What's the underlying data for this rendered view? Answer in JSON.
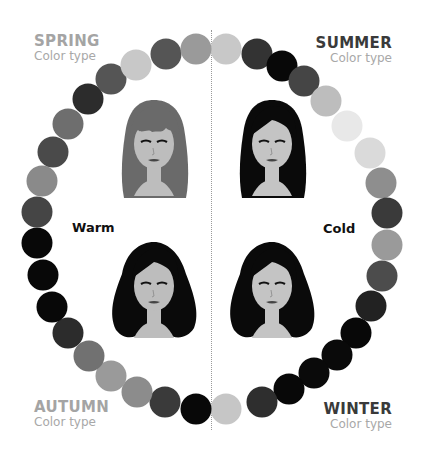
{
  "seasons": {
    "spring": {
      "name": "SPRING",
      "subtitle": "Color type"
    },
    "summer": {
      "name": "SUMMER",
      "subtitle": "Color type"
    },
    "autumn": {
      "name": "AUTUMN",
      "subtitle": "Color type"
    },
    "winter": {
      "name": "WINTER",
      "subtitle": "Color type"
    }
  },
  "axis_labels": {
    "warm": "Warm",
    "cold": "Cold"
  },
  "portraits": [
    {
      "id": "spring",
      "hair": "#6a6a6a",
      "skin": "#bdbdbd",
      "x": 104,
      "y": 92
    },
    {
      "id": "summer",
      "hair": "#0a0a0a",
      "skin": "#c4c4c4",
      "x": 222,
      "y": 92
    },
    {
      "id": "autumn",
      "hair": "#0a0a0a",
      "skin": "#bdbdbd",
      "x": 104,
      "y": 234
    },
    {
      "id": "winter",
      "hair": "#0a0a0a",
      "skin": "#c4c4c4",
      "x": 222,
      "y": 234
    }
  ],
  "ring": [
    {
      "x": 226,
      "y": 49,
      "c": "#c8c8c8"
    },
    {
      "x": 257,
      "y": 54,
      "c": "#333333"
    },
    {
      "x": 282,
      "y": 66,
      "c": "#080808"
    },
    {
      "x": 304,
      "y": 81,
      "c": "#454545"
    },
    {
      "x": 326,
      "y": 101,
      "c": "#bdbdbd"
    },
    {
      "x": 347,
      "y": 126,
      "c": "#e8e8e8"
    },
    {
      "x": 370,
      "y": 153,
      "c": "#dadada"
    },
    {
      "x": 381,
      "y": 183,
      "c": "#8e8e8e"
    },
    {
      "x": 387,
      "y": 213,
      "c": "#3a3a3a"
    },
    {
      "x": 387,
      "y": 245,
      "c": "#9a9a9a"
    },
    {
      "x": 382,
      "y": 276,
      "c": "#4c4c4c"
    },
    {
      "x": 371,
      "y": 306,
      "c": "#222222"
    },
    {
      "x": 356,
      "y": 333,
      "c": "#080808"
    },
    {
      "x": 337,
      "y": 355,
      "c": "#0a0a0a"
    },
    {
      "x": 314,
      "y": 373,
      "c": "#0a0a0a"
    },
    {
      "x": 289,
      "y": 389,
      "c": "#080808"
    },
    {
      "x": 262,
      "y": 402,
      "c": "#2e2e2e"
    },
    {
      "x": 226,
      "y": 409,
      "c": "#c6c6c6"
    },
    {
      "x": 196,
      "y": 409,
      "c": "#080808"
    },
    {
      "x": 165,
      "y": 402,
      "c": "#3a3a3a"
    },
    {
      "x": 137,
      "y": 392,
      "c": "#8c8c8c"
    },
    {
      "x": 111,
      "y": 376,
      "c": "#9a9a9a"
    },
    {
      "x": 89,
      "y": 356,
      "c": "#717171"
    },
    {
      "x": 68,
      "y": 333,
      "c": "#2c2c2c"
    },
    {
      "x": 52,
      "y": 307,
      "c": "#080808"
    },
    {
      "x": 43,
      "y": 275,
      "c": "#080808"
    },
    {
      "x": 37,
      "y": 243,
      "c": "#080808"
    },
    {
      "x": 37,
      "y": 212,
      "c": "#454545"
    },
    {
      "x": 42,
      "y": 181,
      "c": "#8a8a8a"
    },
    {
      "x": 53,
      "y": 152,
      "c": "#4a4a4a"
    },
    {
      "x": 68,
      "y": 124,
      "c": "#6e6e6e"
    },
    {
      "x": 88,
      "y": 99,
      "c": "#2c2c2c"
    },
    {
      "x": 111,
      "y": 79,
      "c": "#555555"
    },
    {
      "x": 136,
      "y": 65,
      "c": "#c8c8c8"
    },
    {
      "x": 166,
      "y": 54,
      "c": "#555555"
    },
    {
      "x": 196,
      "y": 49,
      "c": "#9a9a9a"
    }
  ]
}
